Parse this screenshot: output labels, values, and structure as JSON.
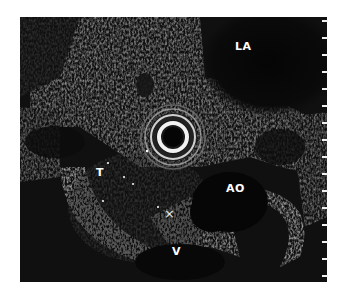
{
  "image": {
    "type": "endoscopic-ultrasound",
    "labels": [
      {
        "id": "la",
        "text": "LA",
        "x": 241,
        "y": 46
      },
      {
        "id": "t",
        "text": "T",
        "x": 97,
        "y": 172
      },
      {
        "id": "ao",
        "text": "AO",
        "x": 227,
        "y": 186
      },
      {
        "id": "v",
        "text": "V",
        "x": 173,
        "y": 248
      }
    ],
    "markers": [
      {
        "id": "x-caliper",
        "text": "×",
        "x": 168,
        "y": 217
      }
    ],
    "scale_ticks": 16
  }
}
